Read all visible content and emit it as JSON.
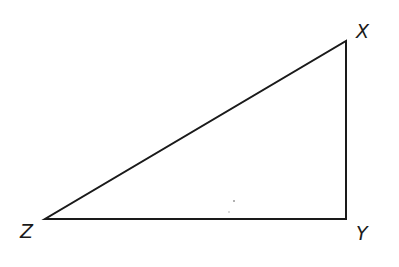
{
  "diagram": {
    "type": "right-triangle",
    "vertices": [
      {
        "label": "X",
        "x": 346,
        "y": 41
      },
      {
        "label": "Y",
        "x": 346,
        "y": 219
      },
      {
        "label": "Z",
        "x": 45,
        "y": 219
      }
    ],
    "right_angle_at": "Y",
    "stroke_color": "#1a1a1a",
    "labels": {
      "x": "X",
      "y": "Y",
      "z": "Z"
    }
  }
}
